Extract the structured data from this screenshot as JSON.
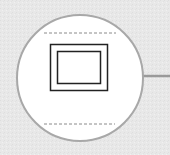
{
  "diagram": {
    "node": {
      "shape": "circle",
      "cx": 80,
      "cy": 78,
      "r": 63,
      "fill": "#ffffff",
      "stroke": "#a8a8a8",
      "icon": "picture-frame-icon"
    },
    "connector": {
      "x1": 143,
      "y1": 76,
      "x2": 170,
      "y2": 76,
      "stroke": "#9a9a9a"
    },
    "background": "#e9e9e9",
    "frame_color": "#222222",
    "dash_color": "#8a8a8a"
  }
}
